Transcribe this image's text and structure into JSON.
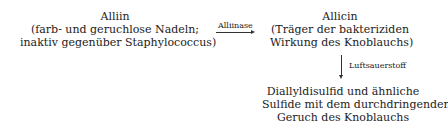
{
  "alliin": {
    "name": "Alliin",
    "lines": [
      "(farb- und geruchlose Nadeln;",
      "inaktiv gegenüber Staphylococcus)"
    ]
  },
  "arrow1": {
    "label": "Alliinase"
  },
  "allicin": {
    "name": "Allicin",
    "lines": [
      "(Träger der bakteriziden",
      "Wirkung des Knoblauchs)"
    ]
  },
  "arrow2": {
    "label": "Luftsauerstoff"
  },
  "products": {
    "lines": [
      "Diallyldisulfid und ähnliche",
      "Sulfide mit dem  durchdringenden",
      "Geruch des Knoblauchs"
    ]
  }
}
